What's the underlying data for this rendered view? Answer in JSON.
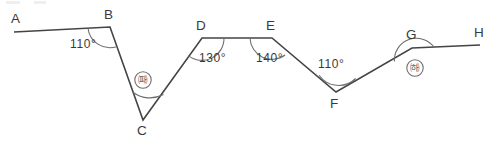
{
  "figure": {
    "stroke_color": "#444444",
    "arc_color": "#6d6d6d",
    "background": "#ffffff",
    "width": 494,
    "height": 143,
    "vertices": [
      {
        "id": "A",
        "label": "A",
        "x": 14,
        "y": 32,
        "label_x": 11,
        "label_y": 12
      },
      {
        "id": "B",
        "label": "B",
        "x": 110,
        "y": 27,
        "label_x": 104,
        "label_y": 8
      },
      {
        "id": "C",
        "label": "C",
        "x": 143,
        "y": 120,
        "label_x": 137,
        "label_y": 124
      },
      {
        "id": "D",
        "label": "D",
        "x": 202,
        "y": 38,
        "label_x": 196,
        "label_y": 19
      },
      {
        "id": "E",
        "label": "E",
        "x": 272,
        "y": 38,
        "label_x": 266,
        "label_y": 19
      },
      {
        "id": "F",
        "label": "F",
        "x": 336,
        "y": 92,
        "label_x": 330,
        "label_y": 97
      },
      {
        "id": "G",
        "label": "G",
        "x": 412,
        "y": 48,
        "label_x": 406,
        "label_y": 28
      },
      {
        "id": "H",
        "label": "H",
        "x": 480,
        "y": 45,
        "label_x": 474,
        "label_y": 26
      }
    ],
    "path": "A,B,C,D,E,F,G,H",
    "angles": [
      {
        "at": "B",
        "label": "110°",
        "type": "value",
        "label_x": 70,
        "label_y": 38
      },
      {
        "at": "C",
        "label": "㈚",
        "type": "marker",
        "label_x": 130,
        "label_y": 74
      },
      {
        "at": "D",
        "label": "130°",
        "type": "value",
        "label_x": 199,
        "label_y": 52
      },
      {
        "at": "E",
        "label": "140°",
        "type": "value",
        "label_x": 256,
        "label_y": 52
      },
      {
        "at": "F",
        "label": "110°",
        "type": "value",
        "label_x": 318,
        "label_y": 58
      },
      {
        "at": "G",
        "label": "㈛",
        "type": "marker",
        "label_x": 405,
        "label_y": 62
      }
    ]
  }
}
